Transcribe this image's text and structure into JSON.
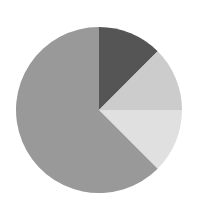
{
  "chart_data": {
    "type": "pie",
    "title": "",
    "legend": [],
    "start_angle_deg": 0,
    "direction": "clockwise",
    "center": [
      99,
      110
    ],
    "radius": 83,
    "slices": [
      {
        "label": "",
        "value": 12.5,
        "color": "#555555"
      },
      {
        "label": "",
        "value": 12.5,
        "color": "#cccccc"
      },
      {
        "label": "",
        "value": 12.5,
        "color": "#e0e0e0"
      },
      {
        "label": "",
        "value": 62.5,
        "color": "#999999"
      }
    ]
  }
}
